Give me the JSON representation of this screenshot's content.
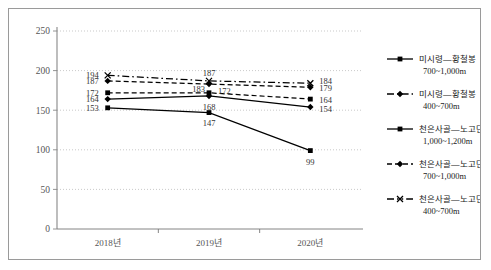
{
  "chart_data": {
    "type": "line",
    "title": "",
    "xlabel": "",
    "ylabel": "",
    "grid": true,
    "legend_position": "right",
    "categories": [
      "2018년",
      "2019년",
      "2020년"
    ],
    "ylim": [
      0,
      250
    ],
    "yticks": [
      0,
      50,
      100,
      150,
      200,
      250
    ],
    "ytick_labels": [
      "0",
      "50",
      "100",
      "150",
      "200",
      "250"
    ],
    "series": [
      {
        "name": "미시령—황철봉 700~1,000m",
        "line_style": "solid",
        "marker": "square",
        "color": "#000000",
        "values": [
          153,
          147,
          99
        ],
        "labels": [
          "153",
          "147",
          "99"
        ]
      },
      {
        "name": "미시령—황철봉 400~700m",
        "line_style": "dashed",
        "marker": "square",
        "color": "#000000",
        "values": [
          172,
          172,
          164
        ],
        "labels": [
          "172",
          "172",
          "164"
        ]
      },
      {
        "name": "천은사골—노고단 1,000~1,200m",
        "line_style": "solid",
        "marker": "diamond",
        "color": "#000000",
        "values": [
          164,
          168,
          154
        ],
        "labels": [
          "164",
          "168",
          "154"
        ]
      },
      {
        "name": "천은사골—노고단 700~1,000m",
        "line_style": "dashed",
        "marker": "diamond",
        "color": "#000000",
        "values": [
          187,
          183,
          179
        ],
        "labels": [
          "187",
          "183",
          "179"
        ]
      },
      {
        "name": "천은사골—노고단 400~700m",
        "line_style": "dashdot",
        "marker": "x",
        "color": "#000000",
        "values": [
          194,
          187,
          184
        ],
        "labels": [
          "194",
          "187",
          "184"
        ]
      }
    ]
  },
  "legend": {
    "items": [
      {
        "line1": "미시령—황철봉",
        "line2": "700~1,000m",
        "style": "solid",
        "marker": "square"
      },
      {
        "line1": "미시령—황철봉",
        "line2": "400~700m",
        "style": "dashdot",
        "marker": "diamond"
      },
      {
        "line1": "천은사골—노고단",
        "line2": "1,000~1,200m",
        "style": "solid",
        "marker": "square"
      },
      {
        "line1": "천은사골—노고단",
        "line2": "700~1,000m",
        "style": "dashed",
        "marker": "diamond"
      },
      {
        "line1": "천은사골—노고단",
        "line2": "400~700m",
        "style": "dashdotdot",
        "marker": "x"
      }
    ]
  },
  "colors": {
    "frame": "#9a9a9a",
    "axis": "#888888",
    "grid": "#bbbbbb",
    "line": "#000000",
    "text": "#333333"
  }
}
